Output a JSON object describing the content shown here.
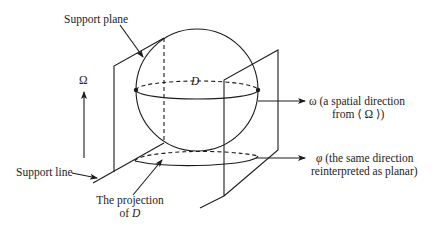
{
  "diagram": {
    "labels": {
      "support_plane": "Support plane",
      "omega_upper": "Ω",
      "d_label": "D",
      "omega_dir_line1": "ω (a spatial direction",
      "omega_dir_line2": "from ⟨ Ω ⟩)",
      "support_line": "Support line",
      "projection_line1": "The projection",
      "projection_line2_prefix": "of ",
      "projection_line2_var": "D",
      "phi_dir_symbol": "φ",
      "phi_dir_line1": " (the same direction",
      "phi_dir_line2": "reinterpreted as planar)"
    },
    "elements": [
      {
        "id": "sphere",
        "type": "circle",
        "description": "Sphere D"
      },
      {
        "id": "equator",
        "type": "ellipse",
        "description": "Equator of D, dashed back half"
      },
      {
        "id": "left-support-plane",
        "type": "plane"
      },
      {
        "id": "right-support-plane",
        "type": "plane"
      },
      {
        "id": "projection-ellipse",
        "type": "ellipse",
        "description": "Projection of D onto ground, dashed back half"
      },
      {
        "id": "omega-arrow",
        "type": "arrow",
        "direction": "up"
      },
      {
        "id": "omega-direction-arrow",
        "type": "arrow",
        "direction": "right"
      },
      {
        "id": "phi-direction-arrow",
        "type": "arrow",
        "direction": "right"
      }
    ],
    "colors": {
      "stroke": "#1c1c1c",
      "background": "#ffffff"
    }
  }
}
